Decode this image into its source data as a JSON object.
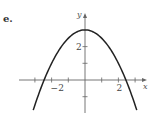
{
  "panel": {
    "label": "e."
  },
  "colors": {
    "axis": "#666666",
    "curve": "#222222",
    "text": "#444444"
  },
  "chart_data": {
    "type": "line",
    "title": "",
    "xlabel": "x",
    "ylabel": "y",
    "function": "y = 3 - 0.5x^2",
    "x": [
      -3.1,
      -2.5,
      -2,
      -1.5,
      -1,
      -0.5,
      0,
      0.5,
      1,
      1.5,
      2,
      2.5,
      3.1
    ],
    "series": [
      {
        "name": "parabola",
        "values": [
          -1.81,
          -0.13,
          1,
          1.88,
          2.5,
          2.88,
          3,
          2.88,
          2.5,
          1.88,
          1,
          -0.13,
          -1.81
        ]
      }
    ],
    "xlim": [
      -3.2,
      3.6
    ],
    "ylim": [
      -1.9,
      3.9
    ],
    "x_ticks": [
      -3,
      -2,
      -1,
      1,
      2,
      3
    ],
    "x_tick_labels": [
      {
        "value": -2,
        "label": "−2"
      },
      {
        "value": 2,
        "label": "2"
      }
    ],
    "y_ticks": [
      -1,
      1,
      2
    ],
    "y_tick_labels": [
      {
        "value": 2,
        "label": "2"
      }
    ],
    "grid": false,
    "legend": null
  }
}
